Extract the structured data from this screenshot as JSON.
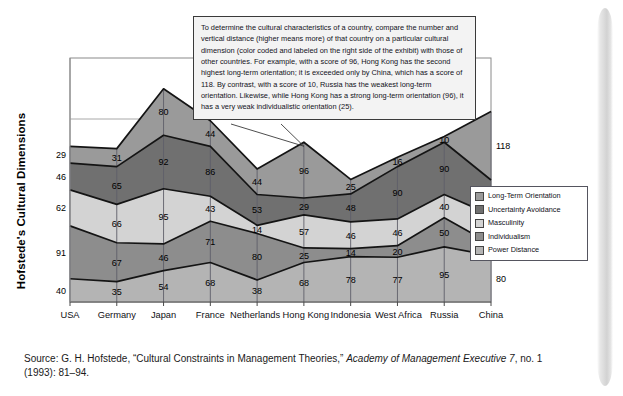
{
  "exhibit": {
    "y_axis_title": "Hofstede's Cultural Dimensions"
  },
  "callout": {
    "text": "To determine the cultural characteristics of a country, compare the number and vertical distance (higher means more) of that country on a particular cultural dimension (color coded and labeled on the right side of the exhibit) with those of other countries.  For example, with a score of 96, Hong Kong has the second highest long-term orientation; it is exceeded only by China, which has a score of 118.  By contrast, with a score of 10, Russia has the weakest long-term orientation.  Likewise, while Hong Kong has a strong long-term orientation (96), it has a very weak individualistic orientation (25)."
  },
  "legend": {
    "items": [
      {
        "label": "Long-Term Orientation",
        "color": "#9a9a9a"
      },
      {
        "label": "Uncertainty Avoidance",
        "color": "#707070"
      },
      {
        "label": "Masculinity",
        "color": "#d3d3d3"
      },
      {
        "label": "Individualism",
        "color": "#8d8d8d"
      },
      {
        "label": "Power Distance",
        "color": "#b4b4b4"
      }
    ]
  },
  "source": {
    "prefix": "Source: G. H. Hofstede, “Cultural Constraints in Management Theories,” ",
    "italic": "Academy of Management Executive 7",
    "suffix": ", no. 1 (1993): 81–94."
  },
  "chart_data": {
    "type": "area",
    "title": "",
    "xlabel": "",
    "ylabel": "Hofstede's Cultural Dimensions",
    "stacked": true,
    "grid": true,
    "legend_position": "right",
    "ylim": [
      0,
      420
    ],
    "categories": [
      "USA",
      "Germany",
      "Japan",
      "France",
      "Netherlands",
      "Hong Kong",
      "Indonesia",
      "West Africa",
      "Russia",
      "China"
    ],
    "series": [
      {
        "name": "Power Distance",
        "color": "#b4b4b4",
        "values": [
          40,
          35,
          54,
          68,
          38,
          68,
          78,
          77,
          95,
          80
        ]
      },
      {
        "name": "Individualism",
        "color": "#8d8d8d",
        "values": [
          91,
          67,
          46,
          71,
          80,
          25,
          14,
          20,
          50,
          20
        ]
      },
      {
        "name": "Masculinity",
        "color": "#d3d3d3",
        "values": [
          62,
          66,
          95,
          43,
          14,
          57,
          46,
          46,
          40,
          50
        ]
      },
      {
        "name": "Uncertainty Avoidance",
        "color": "#707070",
        "values": [
          46,
          65,
          92,
          86,
          53,
          29,
          48,
          90,
          90,
          60
        ]
      },
      {
        "name": "Long-Term Orientation",
        "color": "#9a9a9a",
        "values": [
          29,
          31,
          80,
          44,
          44,
          96,
          25,
          16,
          10,
          118
        ]
      }
    ],
    "gridlines": [
      105,
      210,
      315,
      420
    ]
  }
}
